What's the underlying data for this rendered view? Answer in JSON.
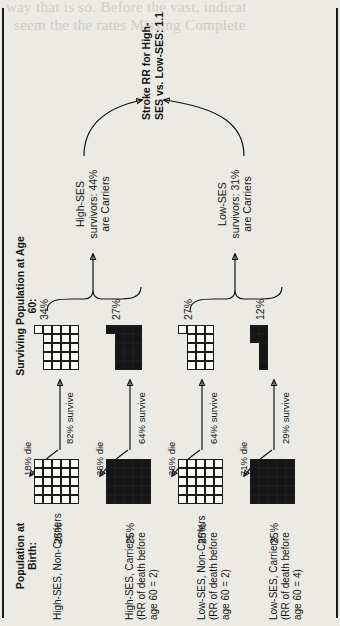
{
  "figure": {
    "column_headers": [
      {
        "id": "birth",
        "text": "Population at\nBirth:"
      },
      {
        "id": "age60",
        "text": "Surviving Population\nat Age 60:"
      }
    ],
    "cohorts": [
      {
        "id": "high-ses-non-carriers",
        "label": "High-SES, Non-Carriers",
        "sublabel": "",
        "birth_pct": "25%",
        "birth_fill": "open",
        "birth_cells": 25,
        "die_label": "18% die",
        "survive_label": "82% survive",
        "survivor_pct": "34%",
        "survivor_fill": "open",
        "survivor_cells": 21
      },
      {
        "id": "high-ses-carriers",
        "label": "High-SES, Carriers",
        "sublabel": "(RR of death before\nage 60 = 2)",
        "birth_pct": "25%",
        "birth_fill": "filled",
        "birth_cells": 25,
        "die_label": "36% die",
        "survive_label": "64% survive",
        "survivor_pct": "27%",
        "survivor_fill": "filled",
        "survivor_cells": 16
      },
      {
        "id": "low-ses-non-carriers",
        "label": "Low-SES, Non-Carriers",
        "sublabel": "(RR of death before\nage 60 = 2)",
        "birth_pct": "25%",
        "birth_fill": "open",
        "birth_cells": 25,
        "die_label": "36% die",
        "survive_label": "64% survive",
        "survivor_pct": "27%",
        "survivor_fill": "open",
        "survivor_cells": 16
      },
      {
        "id": "low-ses-carriers",
        "label": "Low-SES, Carriers",
        "sublabel": "(RR of death before\nage 60 = 4)",
        "birth_pct": "25%",
        "birth_fill": "filled",
        "birth_cells": 25,
        "die_label": "71% die",
        "survive_label": "29% survive",
        "survivor_pct": "12%",
        "survivor_fill": "filled",
        "survivor_cells": 7
      }
    ],
    "braces": [
      {
        "id": "high-ses-summary",
        "text": "High-SES\nsurvivors: 44%\nare Carriers"
      },
      {
        "id": "low-ses-summary",
        "text": "Low-SES\nsurvivors: 31%\nare Carriers"
      }
    ],
    "conclusion": "Stroke RR for High-\nSES vs. Low-SES: 1.1"
  },
  "ghost_text": {
    "top_line_1": "way that is so. Before the vast, indicat",
    "top_line_2": "seem the the rates Missing Complete"
  }
}
